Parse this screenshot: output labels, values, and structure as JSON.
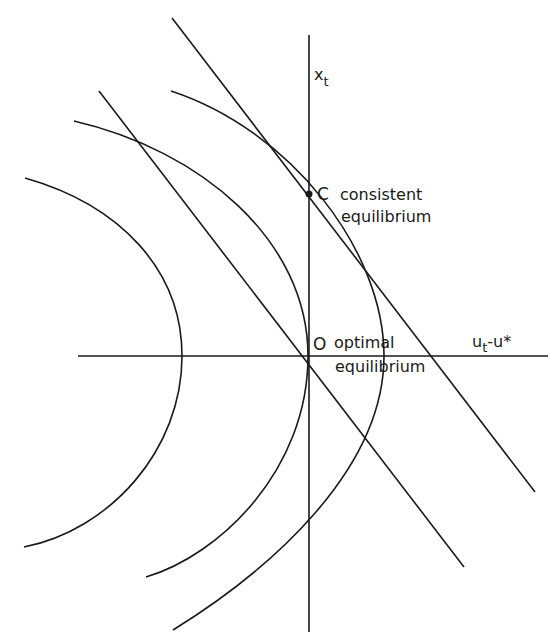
{
  "diagram": {
    "axes": {
      "y_label": "x",
      "y_label_sub": "t",
      "x_label_main": "u",
      "x_label_sub": "t",
      "x_label_rest": "-u*"
    },
    "points": [
      {
        "id": "C",
        "letter": "C",
        "line1": "consistent",
        "line2": "equilibrium"
      },
      {
        "id": "O",
        "letter": "O",
        "line1": "optimal",
        "line2": "equilibrium"
      }
    ],
    "stroke_color": "#1a1a1a",
    "background": "#ffffff"
  }
}
